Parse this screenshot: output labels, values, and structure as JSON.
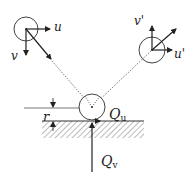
{
  "diagram": {
    "labels": {
      "u": "u",
      "v": "v",
      "u_prime": "u'",
      "v_prime": "v'",
      "r": "r",
      "Q": "Q",
      "Q_u_sub": "u",
      "Q_v_sub": "v"
    },
    "colors": {
      "stroke": "#333333",
      "hatch": "#777777",
      "background": "#ffffff"
    },
    "elements": {
      "incoming_particle": {
        "cx": 26,
        "cy": 29,
        "r": 12
      },
      "outgoing_particle": {
        "cx": 152,
        "cy": 50,
        "r": 13
      },
      "contact_particle": {
        "cx": 92,
        "cy": 107,
        "r": 13
      },
      "ground_y": 121
    }
  }
}
